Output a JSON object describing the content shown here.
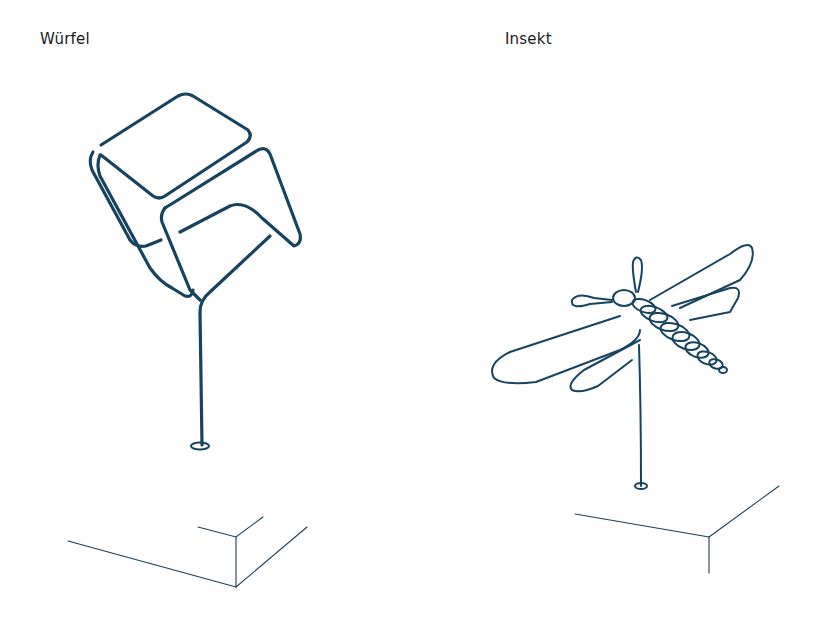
{
  "figure": {
    "panels": [
      {
        "label": "Würfel",
        "subject": "wire-cube-sculpture",
        "color": "#17435e"
      },
      {
        "label": "Insekt",
        "subject": "wire-insect-sculpture",
        "color": "#17435e"
      }
    ]
  }
}
